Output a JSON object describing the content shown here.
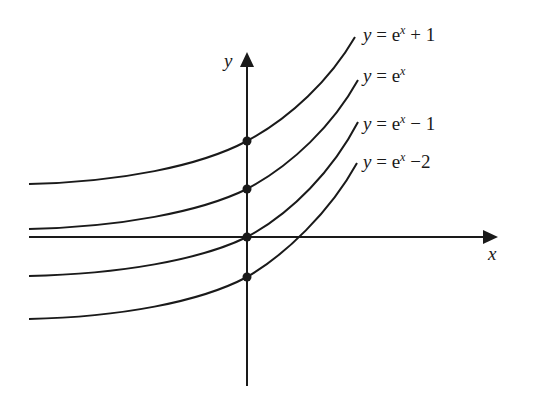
{
  "diagram": {
    "title": "",
    "axes": {
      "x_label": "x",
      "y_label": "y"
    },
    "curves": [
      {
        "id": "exp-plus-1",
        "lhs": "y",
        "eq": "=",
        "base": "e",
        "exp": "x",
        "tail": "+ 1",
        "y_intercept": 2
      },
      {
        "id": "exp",
        "lhs": "y",
        "eq": "=",
        "base": "e",
        "exp": "x",
        "tail": "",
        "y_intercept": 1
      },
      {
        "id": "exp-minus-1",
        "lhs": "y",
        "eq": "=",
        "base": "e",
        "exp": "x",
        "tail": "− 1",
        "y_intercept": 0
      },
      {
        "id": "exp-minus-2",
        "lhs": "y",
        "eq": "=",
        "base": "e",
        "exp": "x",
        "tail": "−2",
        "y_intercept": -1
      }
    ],
    "colors": {
      "ink": "#1a1a1a",
      "background": "#ffffff"
    }
  }
}
